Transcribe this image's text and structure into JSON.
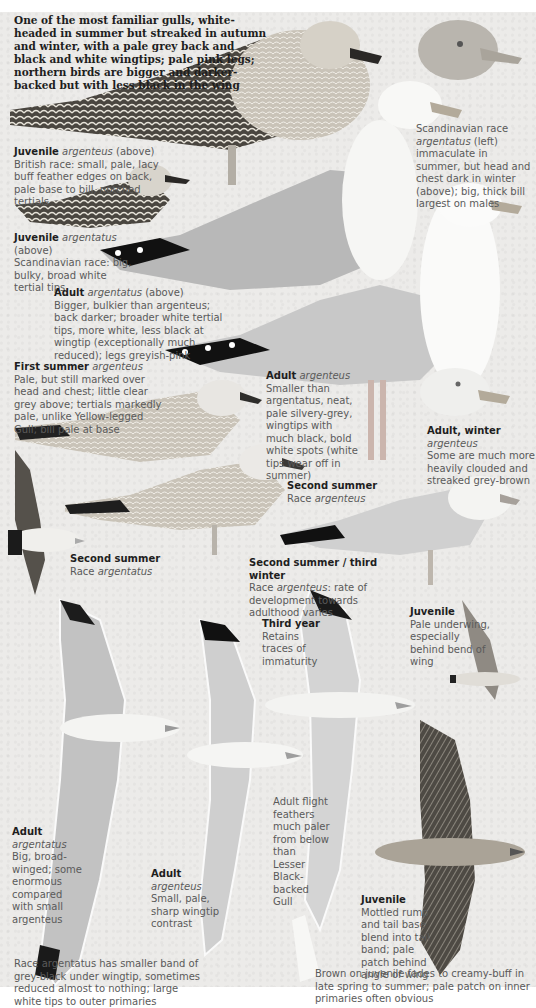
{
  "page": {
    "background_color": "#ecebe9",
    "label_heading_color": "#1e1e1e",
    "label_body_color": "#5a5a5a"
  },
  "intro": {
    "text": "One of the most familiar gulls, white-headed in summer but streaked in autumn and winter, with a pale grey back and black and white wingtips; pale pink legs; northern birds are bigger and darker-backed but with less black in the wing"
  },
  "captions": [
    {
      "id": "juv-argenteus",
      "heading": "Juvenile",
      "race": "argenteus",
      "suffix": "(above)",
      "body": "British race: small, pale, lacy buff feather edges on back, pale base to bill, notched tertials"
    },
    {
      "id": "juv-argentatus",
      "heading": "Juvenile",
      "race": "argentatus",
      "suffix": "(above)",
      "body": "Scandinavian race: big, bulky, broad white tertial tips"
    },
    {
      "id": "scand-head",
      "heading": "",
      "race": "argentatus",
      "prefix": "Scandinavian race",
      "body": "(left) immaculate in summer, but head and chest dark in winter (above); big, thick bill largest on males"
    },
    {
      "id": "adult-argentatus",
      "heading": "Adult",
      "race": "argentatus",
      "suffix": "(above)",
      "body": "Bigger, bulkier than argenteus; back darker; broader white tertial tips, more white, less black at wingtip (exceptionally much reduced); legs greyish-pink"
    },
    {
      "id": "first-summer",
      "heading": "First summer",
      "race": "argenteus",
      "suffix": "",
      "body": "Pale, but still marked over head and chest; little clear grey above; tertials markedly pale, unlike Yellow-legged Gull; bill pale at base"
    },
    {
      "id": "adult-argenteus",
      "heading": "Adult",
      "race": "argenteus",
      "suffix": "",
      "body": "Smaller than argentatus, neat, pale silvery-grey, wingtips with much black, bold white spots (white tips wear off in summer)"
    },
    {
      "id": "adult-winter",
      "heading": "Adult, winter",
      "race": "argenteus",
      "suffix": "",
      "body": "Some are much more heavily clouded and streaked grey-brown"
    },
    {
      "id": "second-summer-argenteus",
      "heading": "Second summer",
      "race": "argenteus",
      "prefix": "Race",
      "body": ""
    },
    {
      "id": "second-summer-argentatus",
      "heading": "Second summer",
      "race": "argentatus",
      "prefix": "Race",
      "body": ""
    },
    {
      "id": "second-summer-third-winter",
      "heading": "Second summer / third winter",
      "race": "argenteus",
      "prefix": "Race",
      "body": ": rate of development towards adulthood varies"
    },
    {
      "id": "third-year",
      "heading": "Third year",
      "race": "",
      "body": "Retains traces of immaturity"
    },
    {
      "id": "juv-underwing",
      "heading": "Juvenile",
      "race": "",
      "body": "Pale underwing, especially behind bend of wing"
    },
    {
      "id": "flight-feathers",
      "heading": "",
      "race": "",
      "body": "Adult flight feathers much paler from below than Lesser Black-backed Gull"
    },
    {
      "id": "adult-argentatus-flight",
      "heading": "Adult",
      "race": "argentatus",
      "suffix": "",
      "body": "Big, broad-winged; some enormous compared with small argenteus"
    },
    {
      "id": "adult-argenteus-flight",
      "heading": "Adult",
      "race": "argenteus",
      "suffix": "",
      "body": "Small, pale, sharp wingtip contrast"
    },
    {
      "id": "juv-flight",
      "heading": "Juvenile",
      "race": "",
      "body": "Mottled rump and tail base blend into tail band; pale patch behind angle of wing"
    }
  ],
  "footnotes": {
    "left": "Race argentatus has smaller band of grey-black under wingtip, sometimes reduced almost to nothing; large white tips to outer primaries",
    "right": "Brown on juvenile fades to creamy-buff in late spring to summer; pale patch on inner primaries often obvious"
  }
}
